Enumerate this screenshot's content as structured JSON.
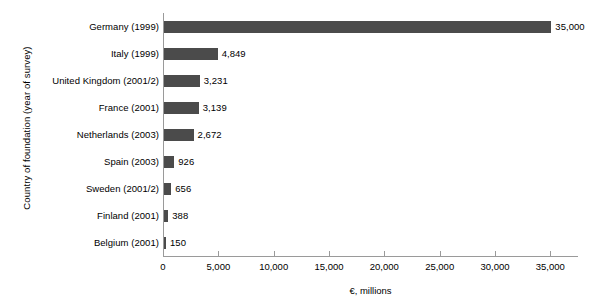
{
  "chart_data": {
    "type": "bar",
    "orientation": "horizontal",
    "title": "",
    "xlabel": "€, millions",
    "ylabel": "Country of foundation (year of survey)",
    "xlim": [
      0,
      37500
    ],
    "xticks": [
      0,
      5000,
      10000,
      15000,
      20000,
      25000,
      30000,
      35000
    ],
    "xtick_labels": [
      "0",
      "5,000",
      "10,000",
      "15,000",
      "20,000",
      "25,000",
      "30,000",
      "35,000"
    ],
    "grid": false,
    "legend": null,
    "bar_color": "#4b4b4b",
    "background_color": "#ffffff",
    "axis_color": "#9a9a9a",
    "categories": [
      "Germany (1999)",
      "Italy (1999)",
      "United Kingdom (2001/2)",
      "France (2001)",
      "Netherlands (2003)",
      "Spain (2003)",
      "Sweden (2001/2)",
      "Finland (2001)",
      "Belgium (2001)"
    ],
    "values": [
      35000,
      4849,
      3231,
      3139,
      2672,
      926,
      656,
      388,
      150
    ],
    "data_labels": [
      "35,000",
      "4,849",
      "3,231",
      "3,139",
      "2,672",
      "926",
      "656",
      "388",
      "150"
    ]
  }
}
